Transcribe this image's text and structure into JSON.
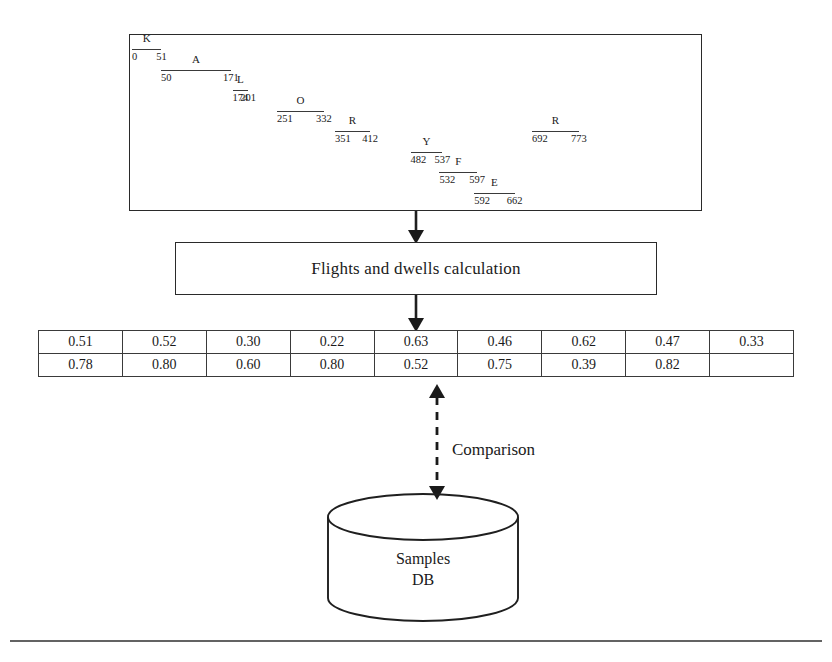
{
  "diagram": {
    "timeline": {
      "name": "keystroke-timeline",
      "unit_label": "ms",
      "axis_start": 0,
      "axis_end": 790,
      "segments": [
        {
          "key": "K",
          "start": 0,
          "end": 51,
          "row": 0
        },
        {
          "key": "A",
          "start": 50,
          "end": 171,
          "row": 1
        },
        {
          "key": "L",
          "start": 174,
          "end": 201,
          "row": 2
        },
        {
          "key": "O",
          "start": 251,
          "end": 332,
          "row": 3
        },
        {
          "key": "R",
          "start": 351,
          "end": 412,
          "row": 4
        },
        {
          "key": "Y",
          "start": 482,
          "end": 537,
          "row": 5
        },
        {
          "key": "F",
          "start": 532,
          "end": 597,
          "row": 6
        },
        {
          "key": "E",
          "start": 592,
          "end": 662,
          "row": 7
        },
        {
          "key": "R",
          "start": 692,
          "end": 773,
          "row": 4
        }
      ]
    },
    "process": {
      "label": "Flights and dwells calculation"
    },
    "values_table": {
      "rows": [
        [
          "0.51",
          "0.52",
          "0.30",
          "0.22",
          "0.63",
          "0.46",
          "0.62",
          "0.47",
          "0.33"
        ],
        [
          "0.78",
          "0.80",
          "0.60",
          "0.80",
          "0.52",
          "0.75",
          "0.39",
          "0.82",
          ""
        ]
      ]
    },
    "comparison": {
      "label": "Comparison"
    },
    "database": {
      "line1": "Samples",
      "line2": "DB"
    },
    "colors": {
      "stroke": "#2a2a2a",
      "text": "#1a1a1a",
      "background": "#ffffff"
    }
  }
}
